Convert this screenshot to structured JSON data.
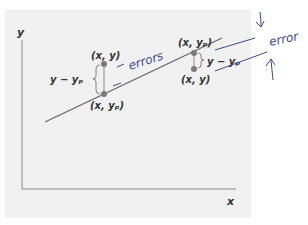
{
  "figure": {
    "axes": {
      "x_label": "x",
      "y_label": "y"
    },
    "point_left": {
      "observed_label": "(x, y)",
      "predicted_label": "(x, yₚ)",
      "residual_label": "y − yₚ"
    },
    "point_right": {
      "observed_label": "(x, y)",
      "predicted_label": "(x, yₚ)",
      "residual_label": "y − yₚ"
    },
    "annotations": {
      "errors_text": "errors",
      "error_text": "error"
    },
    "colors": {
      "panel": "#f1f1f1",
      "line": "#666666",
      "point": "#7a7a7a",
      "ink": "#3a4a8a"
    }
  }
}
